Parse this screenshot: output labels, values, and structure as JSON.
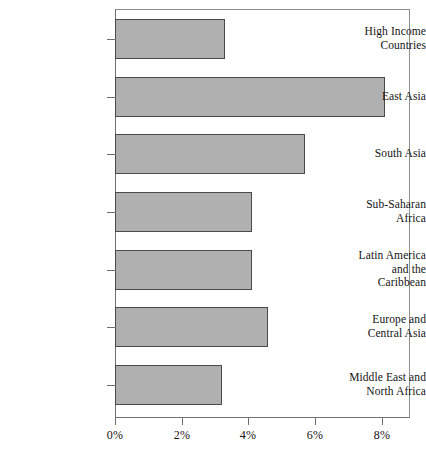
{
  "chart_data": {
    "type": "bar",
    "orientation": "horizontal",
    "title": "",
    "subtitle": "",
    "xlabel": "",
    "ylabel": "",
    "categories": [
      "High Income Countries",
      "East Asia",
      "South Asia",
      "Sub-Saharan Africa",
      "Latin America and the Caribbean",
      "Europe and Central Asia",
      "Middle East and North Africa"
    ],
    "values": [
      3.3,
      8.1,
      5.7,
      4.1,
      4.1,
      4.6,
      3.2
    ],
    "value_unit": "%",
    "xlim": [
      0,
      8.85
    ],
    "xticks": [
      0,
      2,
      4,
      6,
      8
    ],
    "xtick_labels": [
      "0%",
      "2%",
      "4%",
      "6%",
      "8%"
    ],
    "grid": false,
    "legend": null,
    "bar_fill_color": "#b0b0b0",
    "bar_edge_color": "#4a4a4a",
    "frame_color": "#6f6f6f",
    "background_color": "#ffffff"
  },
  "category_label_lines": [
    [
      "High Income",
      "Countries"
    ],
    [
      "East Asia"
    ],
    [
      "South Asia"
    ],
    [
      "Sub-Saharan",
      "Africa"
    ],
    [
      "Latin America",
      "and the",
      "Caribbean"
    ],
    [
      "Europe and",
      "Central Asia"
    ],
    [
      "Middle East and",
      "North Africa"
    ]
  ]
}
